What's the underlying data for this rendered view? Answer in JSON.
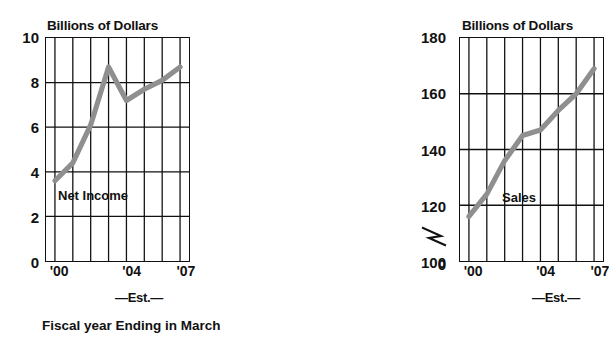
{
  "caption": "Fiscal year Ending in March",
  "panels": {
    "left": {
      "axis_title": "Billions of Dollars",
      "series_label": "Net Income",
      "est_label": "—Est.—"
    },
    "right": {
      "axis_title": "Billions of Dollars",
      "series_label": "Sales",
      "est_label": "—Est.—"
    }
  },
  "colors": {
    "line": "#8f8f8f",
    "axis": "#111111",
    "grid": "#111111",
    "background": "#ffffff"
  },
  "chart_data": [
    {
      "type": "line",
      "title": "Billions of Dollars",
      "series_name": "Net Income",
      "xlabel": "Fiscal year Ending in March",
      "ylabel": "Billions of Dollars",
      "x": [
        2000,
        2001,
        2002,
        2003,
        2004,
        2005,
        2006,
        2007
      ],
      "xtick_labels": [
        "'00",
        "'04",
        "'07"
      ],
      "xtick_positions": [
        2000,
        2004,
        2007
      ],
      "values": [
        3.6,
        4.4,
        6.1,
        8.7,
        7.2,
        7.7,
        8.1,
        8.7
      ],
      "ylim": [
        0,
        10
      ],
      "yticks": [
        0,
        2,
        4,
        6,
        8,
        10
      ],
      "ytick_labels": [
        "0",
        "2",
        "4",
        "6",
        "8",
        "10"
      ],
      "xlim": [
        1999.5,
        2007.5
      ],
      "grid": true,
      "axis_break": false,
      "annotation": "—Est.—",
      "estimate_range": [
        2004,
        2007
      ]
    },
    {
      "type": "line",
      "title": "Billions of Dollars",
      "series_name": "Sales",
      "xlabel": "Fiscal year Ending in March",
      "ylabel": "Billions of Dollars",
      "x": [
        2000,
        2001,
        2002,
        2003,
        2004,
        2005,
        2006,
        2007
      ],
      "xtick_labels": [
        "'00",
        "'04",
        "'07"
      ],
      "xtick_positions": [
        2000,
        2004,
        2007
      ],
      "values": [
        116,
        124,
        136,
        145,
        147,
        154,
        160,
        169
      ],
      "ylim": [
        100,
        180
      ],
      "yticks": [
        100,
        120,
        140,
        160,
        180
      ],
      "ytick_labels": [
        "100",
        "120",
        "140",
        "160",
        "180"
      ],
      "extra_ytick_labels": [
        "0"
      ],
      "xlim": [
        1999.5,
        2007.5
      ],
      "grid": true,
      "axis_break": true,
      "annotation": "—Est.—",
      "estimate_range": [
        2004,
        2007
      ]
    }
  ]
}
